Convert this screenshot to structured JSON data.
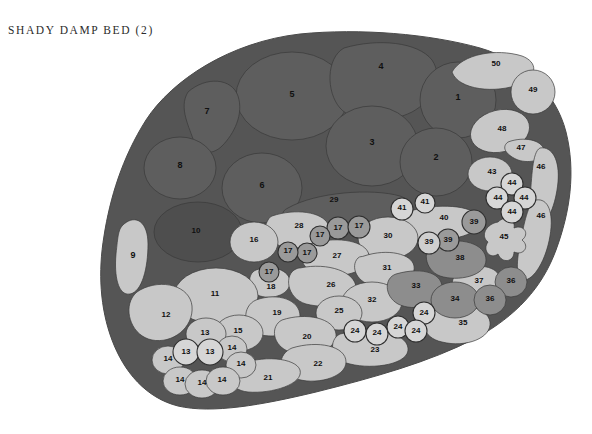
{
  "page": {
    "title": "SHADY DAMP BED (2)",
    "width": 592,
    "height": 434
  },
  "colors": {
    "background": "#ffffff",
    "bed_base": "#555555",
    "dark_region": "#5e5e5e",
    "darker_region": "#4e4e4e",
    "mid_region": "#8d8d8d",
    "light_region": "#c3c3c3",
    "lighter_region": "#cfcfcf",
    "outline": "#3a3a3a",
    "label_text": "#101010",
    "title_text": "#2b2b2b"
  },
  "chart_data": {
    "type": "map",
    "title": "SHADY DAMP BED (2)",
    "legend_position": "none",
    "grid": false,
    "tones": [
      "dark",
      "darker",
      "mid",
      "light",
      "lighter"
    ],
    "region_count": 50,
    "label_range": [
      1,
      50
    ],
    "regions": [
      {
        "id": 1,
        "label": "1",
        "tone": "dark"
      },
      {
        "id": 2,
        "label": "2",
        "tone": "dark"
      },
      {
        "id": 3,
        "label": "3",
        "tone": "dark"
      },
      {
        "id": 4,
        "label": "4",
        "tone": "dark"
      },
      {
        "id": 5,
        "label": "5",
        "tone": "dark"
      },
      {
        "id": 6,
        "label": "6",
        "tone": "darker"
      },
      {
        "id": 7,
        "label": "7",
        "tone": "dark"
      },
      {
        "id": 8,
        "label": "8",
        "tone": "darker"
      },
      {
        "id": 9,
        "label": "9",
        "tone": "light"
      },
      {
        "id": 10,
        "label": "10",
        "tone": "darker"
      },
      {
        "id": 11,
        "label": "11",
        "tone": "light"
      },
      {
        "id": 12,
        "label": "12",
        "tone": "light"
      },
      {
        "id": 13,
        "label": "13",
        "tone": "light"
      },
      {
        "id": 14,
        "label": "14",
        "tone": "light"
      },
      {
        "id": 15,
        "label": "15",
        "tone": "light"
      },
      {
        "id": 16,
        "label": "16",
        "tone": "light"
      },
      {
        "id": 17,
        "label": "17",
        "tone": "mid"
      },
      {
        "id": 18,
        "label": "18",
        "tone": "light"
      },
      {
        "id": 19,
        "label": "19",
        "tone": "light"
      },
      {
        "id": 20,
        "label": "20",
        "tone": "light"
      },
      {
        "id": 21,
        "label": "21",
        "tone": "light"
      },
      {
        "id": 22,
        "label": "22",
        "tone": "light"
      },
      {
        "id": 23,
        "label": "23",
        "tone": "light"
      },
      {
        "id": 24,
        "label": "24",
        "tone": "lighter"
      },
      {
        "id": 25,
        "label": "25",
        "tone": "light"
      },
      {
        "id": 26,
        "label": "26",
        "tone": "light"
      },
      {
        "id": 27,
        "label": "27",
        "tone": "light"
      },
      {
        "id": 28,
        "label": "28",
        "tone": "light"
      },
      {
        "id": 29,
        "label": "29",
        "tone": "dark"
      },
      {
        "id": 30,
        "label": "30",
        "tone": "light"
      },
      {
        "id": 31,
        "label": "31",
        "tone": "light"
      },
      {
        "id": 32,
        "label": "32",
        "tone": "light"
      },
      {
        "id": 33,
        "label": "33",
        "tone": "mid"
      },
      {
        "id": 34,
        "label": "34",
        "tone": "mid"
      },
      {
        "id": 35,
        "label": "35",
        "tone": "light"
      },
      {
        "id": 36,
        "label": "36",
        "tone": "mid"
      },
      {
        "id": 37,
        "label": "37",
        "tone": "light"
      },
      {
        "id": 38,
        "label": "38",
        "tone": "mid"
      },
      {
        "id": 39,
        "label": "39",
        "tone": "mid"
      },
      {
        "id": 40,
        "label": "40",
        "tone": "light"
      },
      {
        "id": 41,
        "label": "41",
        "tone": "lighter"
      },
      {
        "id": 43,
        "label": "43",
        "tone": "light"
      },
      {
        "id": 44,
        "label": "44",
        "tone": "lighter"
      },
      {
        "id": 45,
        "label": "45",
        "tone": "light"
      },
      {
        "id": 46,
        "label": "46",
        "tone": "light"
      },
      {
        "id": 47,
        "label": "47",
        "tone": "light"
      },
      {
        "id": 48,
        "label": "48",
        "tone": "light"
      },
      {
        "id": 49,
        "label": "49",
        "tone": "light"
      },
      {
        "id": 50,
        "label": "50",
        "tone": "light"
      }
    ],
    "labels": [
      {
        "text": "50",
        "x": 496,
        "y": 64
      },
      {
        "text": "49",
        "x": 533,
        "y": 90
      },
      {
        "text": "4",
        "x": 381,
        "y": 67
      },
      {
        "text": "1",
        "x": 458,
        "y": 98
      },
      {
        "text": "5",
        "x": 292,
        "y": 95
      },
      {
        "text": "7",
        "x": 207,
        "y": 112
      },
      {
        "text": "48",
        "x": 502,
        "y": 129
      },
      {
        "text": "47",
        "x": 521,
        "y": 148
      },
      {
        "text": "46",
        "x": 541,
        "y": 167
      },
      {
        "text": "3",
        "x": 372,
        "y": 143
      },
      {
        "text": "2",
        "x": 436,
        "y": 158
      },
      {
        "text": "43",
        "x": 492,
        "y": 172
      },
      {
        "text": "8",
        "x": 180,
        "y": 166
      },
      {
        "text": "6",
        "x": 262,
        "y": 186
      },
      {
        "text": "44",
        "x": 512,
        "y": 183
      },
      {
        "text": "44",
        "x": 498,
        "y": 198
      },
      {
        "text": "44",
        "x": 524,
        "y": 198
      },
      {
        "text": "44",
        "x": 512,
        "y": 212
      },
      {
        "text": "29",
        "x": 334,
        "y": 200
      },
      {
        "text": "41",
        "x": 402,
        "y": 208
      },
      {
        "text": "41",
        "x": 425,
        "y": 202
      },
      {
        "text": "40",
        "x": 444,
        "y": 218
      },
      {
        "text": "46",
        "x": 541,
        "y": 216
      },
      {
        "text": "39",
        "x": 474,
        "y": 222
      },
      {
        "text": "28",
        "x": 299,
        "y": 226
      },
      {
        "text": "17",
        "x": 338,
        "y": 228
      },
      {
        "text": "17",
        "x": 359,
        "y": 226
      },
      {
        "text": "10",
        "x": 196,
        "y": 231
      },
      {
        "text": "16",
        "x": 254,
        "y": 240
      },
      {
        "text": "17",
        "x": 320,
        "y": 235
      },
      {
        "text": "30",
        "x": 388,
        "y": 236
      },
      {
        "text": "39",
        "x": 429,
        "y": 242
      },
      {
        "text": "39",
        "x": 448,
        "y": 240
      },
      {
        "text": "45",
        "x": 504,
        "y": 237
      },
      {
        "text": "9",
        "x": 133,
        "y": 256
      },
      {
        "text": "17",
        "x": 288,
        "y": 251
      },
      {
        "text": "17",
        "x": 307,
        "y": 253
      },
      {
        "text": "27",
        "x": 337,
        "y": 256
      },
      {
        "text": "38",
        "x": 460,
        "y": 258
      },
      {
        "text": "17",
        "x": 269,
        "y": 272
      },
      {
        "text": "31",
        "x": 387,
        "y": 268
      },
      {
        "text": "18",
        "x": 271,
        "y": 287
      },
      {
        "text": "26",
        "x": 331,
        "y": 285
      },
      {
        "text": "37",
        "x": 479,
        "y": 281
      },
      {
        "text": "36",
        "x": 511,
        "y": 281
      },
      {
        "text": "11",
        "x": 215,
        "y": 294
      },
      {
        "text": "33",
        "x": 416,
        "y": 286
      },
      {
        "text": "34",
        "x": 455,
        "y": 299
      },
      {
        "text": "36",
        "x": 490,
        "y": 299
      },
      {
        "text": "32",
        "x": 372,
        "y": 300
      },
      {
        "text": "12",
        "x": 166,
        "y": 315
      },
      {
        "text": "25",
        "x": 339,
        "y": 311
      },
      {
        "text": "19",
        "x": 277,
        "y": 313
      },
      {
        "text": "24",
        "x": 424,
        "y": 313
      },
      {
        "text": "35",
        "x": 463,
        "y": 323
      },
      {
        "text": "13",
        "x": 205,
        "y": 333
      },
      {
        "text": "15",
        "x": 238,
        "y": 331
      },
      {
        "text": "20",
        "x": 307,
        "y": 337
      },
      {
        "text": "24",
        "x": 355,
        "y": 331
      },
      {
        "text": "24",
        "x": 377,
        "y": 333
      },
      {
        "text": "24",
        "x": 398,
        "y": 327
      },
      {
        "text": "24",
        "x": 416,
        "y": 331
      },
      {
        "text": "13",
        "x": 186,
        "y": 352
      },
      {
        "text": "13",
        "x": 210,
        "y": 352
      },
      {
        "text": "14",
        "x": 232,
        "y": 348
      },
      {
        "text": "14",
        "x": 168,
        "y": 359
      },
      {
        "text": "14",
        "x": 241,
        "y": 364
      },
      {
        "text": "23",
        "x": 375,
        "y": 350
      },
      {
        "text": "22",
        "x": 318,
        "y": 364
      },
      {
        "text": "21",
        "x": 268,
        "y": 378
      },
      {
        "text": "14",
        "x": 180,
        "y": 380
      },
      {
        "text": "14",
        "x": 202,
        "y": 383
      },
      {
        "text": "14",
        "x": 222,
        "y": 380
      }
    ]
  }
}
